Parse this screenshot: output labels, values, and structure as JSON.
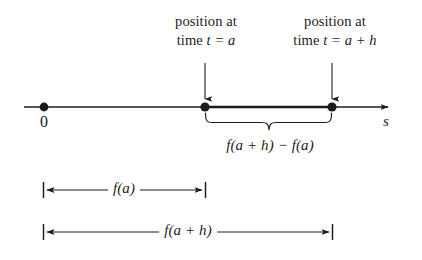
{
  "figure": {
    "type": "number-line-diagram",
    "background_color": "#ffffff",
    "ink_color": "#1c1c1c",
    "axis_label": "s",
    "origin_label": "0"
  },
  "callouts": [
    {
      "id": "position-at-time-a",
      "line1": "position at",
      "line2_prefix": "time ",
      "line2_math": "t = a",
      "points_to": "point-a"
    },
    {
      "id": "position-at-time-a-plus-h",
      "line1": "position at",
      "line2_prefix": "time ",
      "line2_math": "t = a + h",
      "points_to": "point-a-plus-h"
    }
  ],
  "points": [
    {
      "id": "origin",
      "label": "0",
      "x": 44
    },
    {
      "id": "point-a",
      "label": "",
      "x": 205
    },
    {
      "id": "point-a-plus-h",
      "label": "",
      "x": 332
    }
  ],
  "brace": {
    "label": "f(a + h) − f(a)",
    "from": "point-a",
    "to": "point-a-plus-h"
  },
  "measures": [
    {
      "id": "measure-fa",
      "label": "f(a)",
      "from": "origin",
      "to": "point-a"
    },
    {
      "id": "measure-fah",
      "label": "f(a + h)",
      "from": "origin",
      "to": "point-a-plus-h"
    }
  ]
}
